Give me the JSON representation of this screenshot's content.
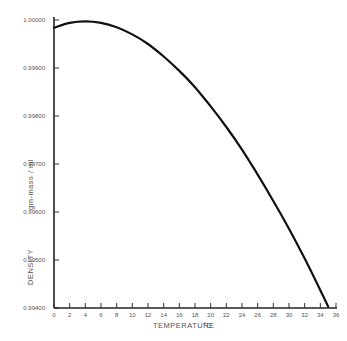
{
  "chart_data": {
    "type": "line",
    "title": "",
    "xlabel": "TEMPERATURE",
    "xunit": "°C",
    "ylabel": "DENSITY",
    "yunit": "gm-mass / ml",
    "xlim": [
      0,
      36
    ],
    "ylim": [
      0.994,
      1.0
    ],
    "grid": false,
    "legend": null,
    "x_ticks": [
      "0",
      "2",
      "4",
      "6",
      "8",
      "10",
      "12",
      "14",
      "16",
      "18",
      "20",
      "22",
      "24",
      "26",
      "28",
      "30",
      "32",
      "34",
      "36"
    ],
    "y_ticks": [
      "0.99400",
      "0.99500",
      "0.99600",
      "0.99700",
      "0.99800",
      "0.99900",
      "1.00000"
    ],
    "series": [
      {
        "name": "Water density",
        "x": [
          0,
          2,
          4,
          6,
          8,
          10,
          12,
          14,
          16,
          18,
          20,
          22,
          24,
          26,
          28,
          30,
          32,
          34,
          35
        ],
        "y": [
          0.99984,
          0.99994,
          0.99997,
          0.99994,
          0.99985,
          0.9997,
          0.9995,
          0.99924,
          0.99894,
          0.9986,
          0.9982,
          0.99777,
          0.9973,
          0.99678,
          0.99623,
          0.99565,
          0.99503,
          0.99437,
          0.99403
        ]
      }
    ]
  },
  "labels": {
    "xlabel": "TEMPERATURE",
    "xunit": "°C",
    "ylabel": "DENSITY",
    "yunit": "gm-mass / ml"
  }
}
